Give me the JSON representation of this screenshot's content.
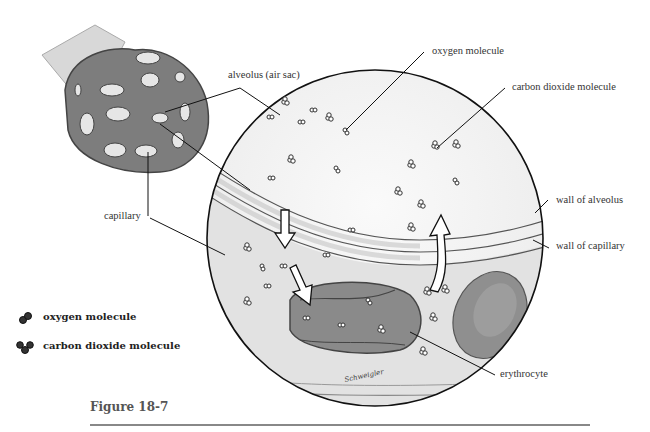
{
  "figure": {
    "caption": "Figure 18-7",
    "signature": "Schweigler"
  },
  "labels": {
    "alveolus": "alveolus (air sac)",
    "oxygen": "oxygen molecule",
    "co2": "carbon dioxide molecule",
    "wall_alveolus": "wall of alveolus",
    "wall_capillary": "wall of capillary",
    "capillary": "capillary",
    "erythrocyte": "erythrocyte"
  },
  "legend": {
    "items": [
      {
        "icon": "oxygen-molecule-icon",
        "label": "oxygen molecule"
      },
      {
        "icon": "carbon-dioxide-molecule-icon",
        "label": "carbon dioxide molecule"
      }
    ]
  },
  "colors": {
    "tissue": "#7a7a7a",
    "rbc": "#8c8c8c",
    "line": "#222222",
    "wall": "#c8c8c8"
  }
}
